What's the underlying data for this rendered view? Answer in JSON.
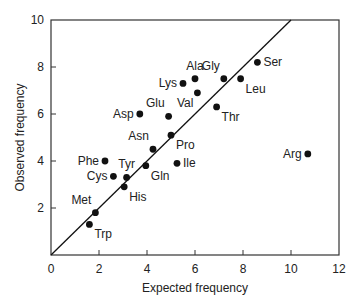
{
  "chart_data": {
    "type": "scatter",
    "title": "",
    "xlabel": "Expected frequency",
    "ylabel": "Observed frequency",
    "xlim": [
      0,
      12
    ],
    "ylim": [
      0,
      10
    ],
    "xticks": [
      0,
      2,
      4,
      6,
      8,
      10,
      12
    ],
    "yticks": [
      2,
      4,
      6,
      8,
      10
    ],
    "grid": false,
    "legend": null,
    "reference_line": {
      "from": [
        0,
        0
      ],
      "to": [
        10,
        10
      ],
      "label": "y = x"
    },
    "points": [
      {
        "label": "Ser",
        "x": 8.6,
        "y": 8.2,
        "label_pos": "right"
      },
      {
        "label": "Gly",
        "x": 7.2,
        "y": 7.5,
        "label_pos": "above-left"
      },
      {
        "label": "Leu",
        "x": 7.9,
        "y": 7.5,
        "label_pos": "below-right"
      },
      {
        "label": "Thr",
        "x": 6.9,
        "y": 6.3,
        "label_pos": "below-right"
      },
      {
        "label": "Ala",
        "x": 6.0,
        "y": 7.5,
        "label_pos": "above"
      },
      {
        "label": "Lys",
        "x": 5.5,
        "y": 7.3,
        "label_pos": "left"
      },
      {
        "label": "Val",
        "x": 6.1,
        "y": 6.9,
        "label_pos": "below-left"
      },
      {
        "label": "Glu",
        "x": 4.9,
        "y": 5.9,
        "label_pos": "above-left"
      },
      {
        "label": "Asp",
        "x": 3.7,
        "y": 6.0,
        "label_pos": "left"
      },
      {
        "label": "Pro",
        "x": 5.0,
        "y": 5.1,
        "label_pos": "below-right"
      },
      {
        "label": "Asn",
        "x": 4.25,
        "y": 4.5,
        "label_pos": "above-left"
      },
      {
        "label": "Ile",
        "x": 5.25,
        "y": 3.9,
        "label_pos": "right"
      },
      {
        "label": "Gln",
        "x": 3.95,
        "y": 3.8,
        "label_pos": "below-right"
      },
      {
        "label": "Phe",
        "x": 2.25,
        "y": 4.0,
        "label_pos": "left"
      },
      {
        "label": "Cys",
        "x": 2.6,
        "y": 3.35,
        "label_pos": "left"
      },
      {
        "label": "Tyr",
        "x": 3.15,
        "y": 3.3,
        "label_pos": "above"
      },
      {
        "label": "His",
        "x": 3.05,
        "y": 2.9,
        "label_pos": "below-right"
      },
      {
        "label": "Met",
        "x": 1.85,
        "y": 1.8,
        "label_pos": "above-left"
      },
      {
        "label": "Trp",
        "x": 1.6,
        "y": 1.3,
        "label_pos": "below-right"
      },
      {
        "label": "Arg",
        "x": 10.7,
        "y": 4.3,
        "label_pos": "left"
      }
    ]
  }
}
